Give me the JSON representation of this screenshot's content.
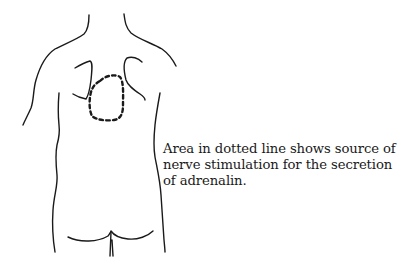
{
  "figure": {
    "colors": {
      "line": "#1a1a1a",
      "background": "#ffffff"
    },
    "caption": {
      "lines": [
        "Area in dotted line shows source of",
        "nerve stimulation for the secretion",
        "of adrenalin."
      ]
    }
  }
}
